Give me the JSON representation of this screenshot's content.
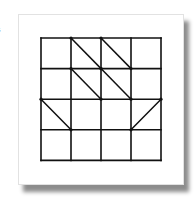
{
  "edge_label": "s",
  "diagram": {
    "type": "grid-with-diagonals",
    "rows": 4,
    "cols": 4,
    "line_color": "#111111",
    "card_background": "#ffffff",
    "diagonals": [
      {
        "row": 0,
        "col": 1,
        "direction": "tl-br"
      },
      {
        "row": 0,
        "col": 2,
        "direction": "tl-br"
      },
      {
        "row": 1,
        "col": 1,
        "direction": "tl-br"
      },
      {
        "row": 1,
        "col": 2,
        "direction": "tl-br"
      },
      {
        "row": 2,
        "col": 0,
        "direction": "tl-br"
      },
      {
        "row": 2,
        "col": 3,
        "direction": "tr-bl"
      }
    ]
  }
}
